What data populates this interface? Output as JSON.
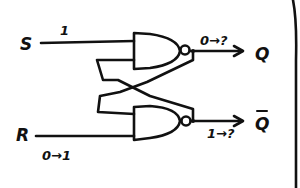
{
  "diagram": {
    "type": "SR latch (cross-coupled NAND gates), hand-drawn",
    "inputs": [
      {
        "name": "S",
        "value_label": "1"
      },
      {
        "name": "R",
        "value_label": "0→1"
      }
    ],
    "outputs": [
      {
        "name": "Q",
        "transition_label": "0→?"
      },
      {
        "name": "Q̄",
        "transition_label": "1→?"
      }
    ],
    "gates": [
      {
        "id": "nand-top",
        "type": "NAND",
        "inputs": [
          "S",
          "Q̄ feedback"
        ],
        "output": "Q"
      },
      {
        "id": "nand-bottom",
        "type": "NAND",
        "inputs": [
          "Q feedback",
          "R"
        ],
        "output": "Q̄"
      }
    ],
    "colors": {
      "ink": "#111111",
      "background": "#ffffff"
    }
  },
  "labels": {
    "s": "S",
    "s_value": "1",
    "r": "R",
    "r_value": "0→1",
    "q": "Q",
    "q_transition": "0→?",
    "qbar": "Q",
    "qbar_overbar": "‾",
    "qbar_transition": "1→?"
  }
}
